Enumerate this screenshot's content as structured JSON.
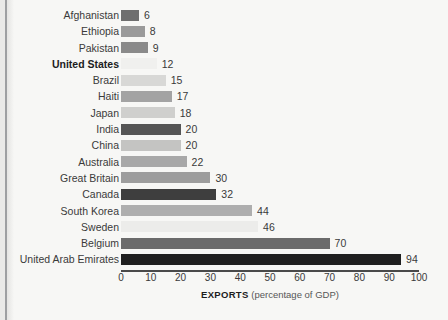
{
  "chart_data": {
    "type": "bar",
    "orientation": "horizontal",
    "title": "",
    "subtitle": "",
    "xlabel": "EXPORTS (percentage of GDP)",
    "xlabel_strong": "EXPORTS",
    "xlabel_soft": "(percentage of GDP)",
    "ylabel": "",
    "xlim": [
      0,
      100
    ],
    "x_ticks": [
      0,
      10,
      20,
      30,
      40,
      50,
      60,
      70,
      80,
      90,
      100
    ],
    "grid": false,
    "legend": "none",
    "categories": [
      "Afghanistan",
      "Ethiopia",
      "Pakistan",
      "United States",
      "Brazil",
      "Haiti",
      "Japan",
      "India",
      "China",
      "Australia",
      "Great Britain",
      "Canada",
      "South Korea",
      "Sweden",
      "Belgium",
      "United Arab Emirates"
    ],
    "values": [
      6,
      8,
      9,
      12,
      15,
      17,
      18,
      20,
      20,
      22,
      30,
      32,
      44,
      46,
      70,
      94
    ],
    "value_labels": [
      "6",
      "8",
      "9",
      "12",
      "15",
      "17",
      "18",
      "20",
      "20",
      "22",
      "30",
      "32",
      "44",
      "46",
      "70",
      "94"
    ],
    "bar_colors": [
      "#6f6f6f",
      "#9a9a9a",
      "#8a8a8a",
      "#f0f0ee",
      "#d8d8d6",
      "#a3a3a3",
      "#cfcfcd",
      "#555555",
      "#c4c4c2",
      "#a8a8a8",
      "#9d9d9d",
      "#3e3e3e",
      "#aeaeae",
      "#ececea",
      "#6b6b6b",
      "#1f1f1f"
    ],
    "highlight_category": "United States"
  },
  "figure": {
    "background_color": "#f7f7f5",
    "axis_color": "#4a4a4a",
    "text_color": "#3a3a3a",
    "gutter_color": "#8d8f92"
  }
}
